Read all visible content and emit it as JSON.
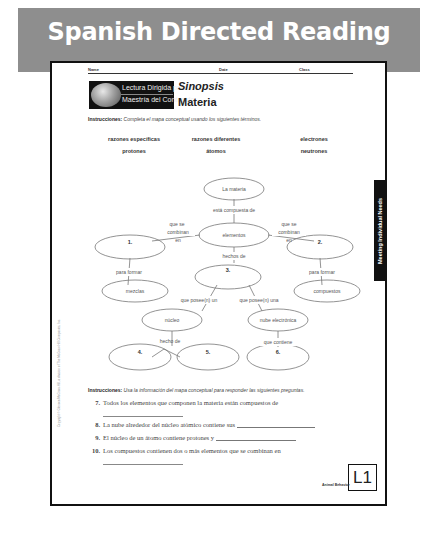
{
  "banner": {
    "title": "Spanish Directed Reading",
    "color": "#8e8e8e"
  },
  "header": {
    "name_label": "Name",
    "date_label": "Date",
    "class_label": "Class"
  },
  "logo": {
    "line1": "Lectura Dirigida para la",
    "line2": "Maestría del Contenido"
  },
  "heading": {
    "kicker": "Sinopsis",
    "title": "Materia"
  },
  "instructions1": {
    "label": "Instrucciones:",
    "text": "Completa el mapa conceptual usando los siguientes términos."
  },
  "terms": [
    [
      "razones específicas",
      "razones diferentes",
      "electrones"
    ],
    [
      "protones",
      "átomos",
      "neutrones"
    ]
  ],
  "concept_map": {
    "nodes": {
      "materia": "La materia",
      "elementos": "elementos",
      "n1": "1.",
      "n2": "2.",
      "n3": "3.",
      "mezclas": "mezclas",
      "compuestos": "compuestos",
      "nucleo": "núcleo",
      "nube": "nube electrónica",
      "n4": "4.",
      "n5": "5.",
      "n6": "6."
    },
    "links": {
      "compuesta": "está compuesta de",
      "combinan_left": [
        "que se",
        "combinan",
        "en"
      ],
      "combinan_right": [
        "que se",
        "combinan",
        "en"
      ],
      "hechos": "hechos de",
      "formar_left": "para formar",
      "formar_right": "para formar",
      "posee_un": "que posee(n) un",
      "posee_una": "que posee(n) una",
      "hecho_de": "hecho de",
      "contiene": "que contiene"
    }
  },
  "instructions2": {
    "label": "Instrucciones:",
    "text": "Usa la información del mapa conceptual para responder las siguientes preguntas."
  },
  "questions": [
    {
      "num": "7.",
      "text": "Todos los elementos que componen la materia están compuestos de"
    },
    {
      "num": "8.",
      "text": "La nube alrededor del núcleo atómico contiene sus"
    },
    {
      "num": "9.",
      "text": "El núcleo de un átomo contiene protones y"
    },
    {
      "num": "10.",
      "text": "Los compuestos contienen dos o más elementos que se combinan en"
    }
  ],
  "side_tab": "Meeting Individual Needs",
  "copyright": "Copyright © Glencoe/McGraw-Hill, a division of The McGraw-Hill Companies, Inc.",
  "level": "L1",
  "footer": "Animal Behavior"
}
